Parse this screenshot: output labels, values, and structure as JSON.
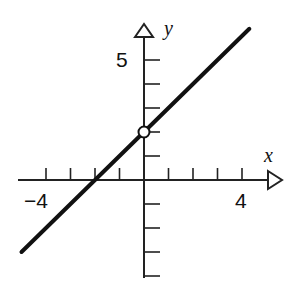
{
  "chart_data": {
    "type": "line",
    "title": "",
    "xlabel": "x",
    "ylabel": "y",
    "x_tick_labels": [
      {
        "value": -4,
        "label": "-4"
      },
      {
        "value": 4,
        "label": "4"
      }
    ],
    "y_tick_labels": [
      {
        "value": 5,
        "label": "5"
      }
    ],
    "x_ticks": [
      -4,
      -3,
      -2,
      -1,
      1,
      2,
      3,
      4
    ],
    "y_ticks": [
      -4,
      -3,
      -2,
      -1,
      1,
      2,
      3,
      4,
      5
    ],
    "xlim": [
      -5,
      5
    ],
    "ylim": [
      -4,
      6
    ],
    "grid": false,
    "series": [
      {
        "name": "y = x + 2 (x ≠ 0)",
        "equation": "y = x + 2",
        "x": [
          -5,
          4.3
        ],
        "y": [
          -3,
          6.3
        ],
        "open_points": [
          {
            "x": 0,
            "y": 2
          }
        ]
      }
    ]
  },
  "labels": {
    "x_axis": "x",
    "y_axis": "y",
    "x_neg": "−4",
    "x_pos": "4",
    "y_pos": "5"
  },
  "colors": {
    "line": "#111111",
    "axis": "#222222",
    "background": "#ffffff"
  }
}
